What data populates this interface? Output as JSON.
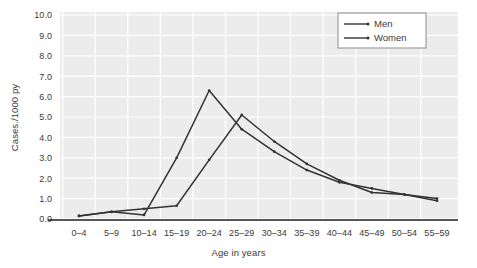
{
  "chart_data": {
    "type": "line",
    "title": "",
    "xlabel": "Age in years",
    "ylabel": "Cases./1000 py",
    "categories": [
      "0–4",
      "5–9",
      "10–14",
      "15–19",
      "20–24",
      "25–29",
      "30–34",
      "35–39",
      "40–44",
      "45–49",
      "50–54",
      "55–59"
    ],
    "ylim": [
      0.0,
      10.0
    ],
    "yticks": [
      "0.0",
      "1.0",
      "2.0",
      "3.0",
      "4.0",
      "5.0",
      "6.0",
      "7.0",
      "8.0",
      "9.0",
      "10.0"
    ],
    "ytick_values": [
      0.0,
      1.0,
      2.0,
      3.0,
      4.0,
      5.0,
      6.0,
      7.0,
      8.0,
      9.0,
      10.0
    ],
    "grid": true,
    "grid_color": "#ffffff",
    "plot_background": "#ececec",
    "legend_position": "top-right",
    "series": [
      {
        "name": "Men",
        "color": "#333333",
        "values": [
          0.15,
          0.35,
          0.2,
          3.0,
          6.3,
          4.4,
          3.3,
          2.4,
          1.8,
          1.5,
          1.2,
          0.9
        ]
      },
      {
        "name": "Women",
        "color": "#333333",
        "values": [
          0.15,
          0.35,
          0.5,
          0.65,
          2.9,
          5.1,
          3.8,
          2.7,
          1.9,
          1.3,
          1.2,
          1.0
        ]
      }
    ]
  }
}
